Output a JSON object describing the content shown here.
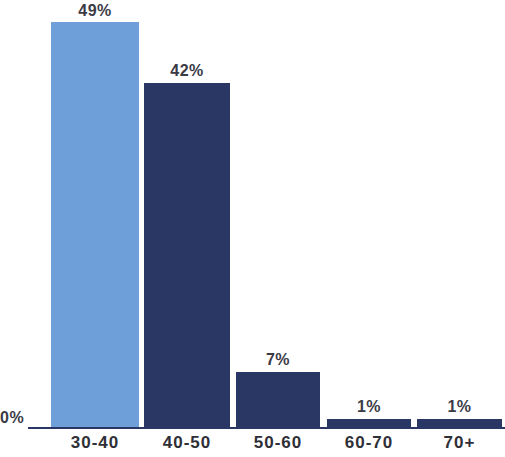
{
  "chart_data": {
    "type": "bar",
    "title": "",
    "xlabel": "",
    "ylabel": "",
    "categories": [
      "30-40",
      "40-50",
      "50-60",
      "60-70",
      "70+"
    ],
    "values": [
      49,
      42,
      7,
      1,
      1
    ],
    "value_labels": [
      "49%",
      "42%",
      "7%",
      "1%",
      "1%"
    ],
    "ylim": [
      0,
      49
    ],
    "grid": false,
    "legend": "none",
    "axis_zero_label": "0%",
    "bar_colors": [
      "#6e9fd8",
      "#2a3764",
      "#2a3764",
      "#2a3764",
      "#2a3764"
    ],
    "axis_color": "#2a3764",
    "background_color": "#ffffff",
    "bars": [
      {
        "category": "30-40",
        "value": 49,
        "label": "49%",
        "color": "#6e9fd8",
        "left": 51,
        "width": 88,
        "top": 22,
        "height": 405
      },
      {
        "category": "40-50",
        "value": 42,
        "label": "42%",
        "color": "#2a3764",
        "left": 144,
        "width": 86,
        "top": 83,
        "height": 344
      },
      {
        "category": "50-60",
        "value": 7,
        "label": "7%",
        "color": "#2a3764",
        "left": 236,
        "width": 84,
        "top": 372,
        "height": 55
      },
      {
        "category": "60-70",
        "value": 1,
        "label": "1%",
        "color": "#2a3764",
        "left": 327,
        "width": 84,
        "top": 419,
        "height": 8
      },
      {
        "category": "70+",
        "value": 1,
        "label": "1%",
        "color": "#2a3764",
        "left": 417,
        "width": 85,
        "top": 419,
        "height": 8
      }
    ]
  }
}
